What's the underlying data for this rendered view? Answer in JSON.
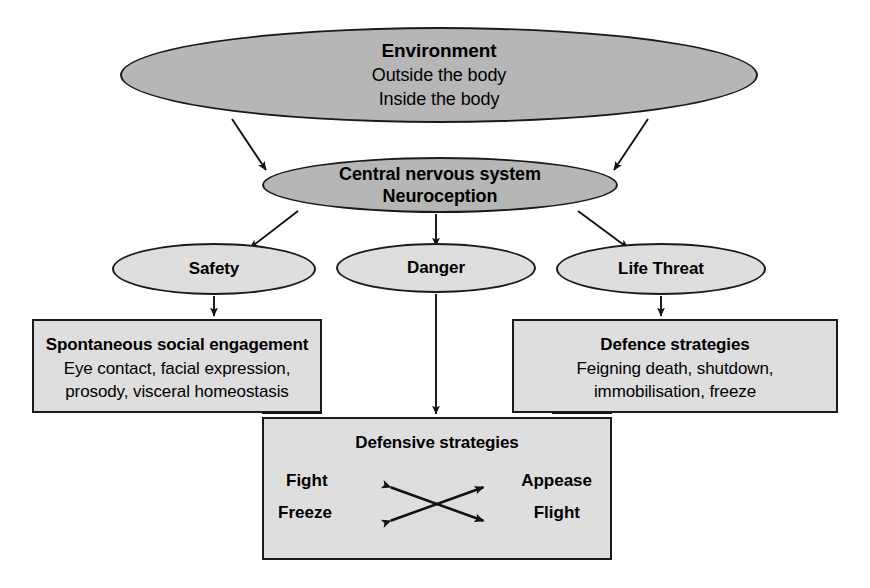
{
  "diagram": {
    "colors": {
      "fill_dark": "#b6b6b6",
      "fill_light": "#dedede",
      "stroke": "#1a1a1a",
      "background": "#ffffff",
      "text": "#000000"
    },
    "nodes": {
      "environment": {
        "shape": "ellipse",
        "title": "Environment",
        "lines": [
          "Outside the body",
          "Inside the body"
        ]
      },
      "central_nervous_system": {
        "shape": "ellipse",
        "title": "Central nervous system",
        "subtitle": "Neuroception"
      },
      "safety": {
        "shape": "ellipse",
        "title": "Safety"
      },
      "danger": {
        "shape": "ellipse",
        "title": "Danger"
      },
      "life_threat": {
        "shape": "ellipse",
        "title": "Life Threat"
      },
      "social_engagement": {
        "shape": "rectangle",
        "title": "Spontaneous social engagement",
        "lines": [
          "Eye contact, facial expression,",
          "prosody, visceral homeostasis"
        ]
      },
      "defence_strategies": {
        "shape": "rectangle",
        "title": "Defence strategies",
        "lines": [
          "Feigning death, shutdown,",
          "immobilisation, freeze"
        ]
      },
      "defensive_strategies": {
        "shape": "rectangle",
        "title": "Defensive strategies",
        "quadrant": {
          "top_left": "Fight",
          "top_right": "Appease",
          "bottom_left": "Freeze",
          "bottom_right": "Flight"
        }
      }
    },
    "edges": [
      {
        "from": "environment",
        "to": "central_nervous_system",
        "style": "arrow"
      },
      {
        "from": "environment",
        "to": "central_nervous_system",
        "style": "arrow"
      },
      {
        "from": "central_nervous_system",
        "to": "safety",
        "style": "arrow"
      },
      {
        "from": "central_nervous_system",
        "to": "danger",
        "style": "arrow"
      },
      {
        "from": "central_nervous_system",
        "to": "life_threat",
        "style": "arrow"
      },
      {
        "from": "safety",
        "to": "social_engagement",
        "style": "arrow"
      },
      {
        "from": "danger",
        "to": "defensive_strategies",
        "style": "arrow"
      },
      {
        "from": "life_threat",
        "to": "defence_strategies",
        "style": "arrow"
      },
      {
        "from": "defence_strategies",
        "to": "defensive_strategies",
        "style": "line"
      },
      {
        "from": "social_engagement",
        "to": "defensive_strategies",
        "style": "line"
      },
      {
        "from": "Fight",
        "to": "Flight",
        "style": "double-arrow"
      },
      {
        "from": "Freeze",
        "to": "Appease",
        "style": "double-arrow"
      }
    ]
  }
}
